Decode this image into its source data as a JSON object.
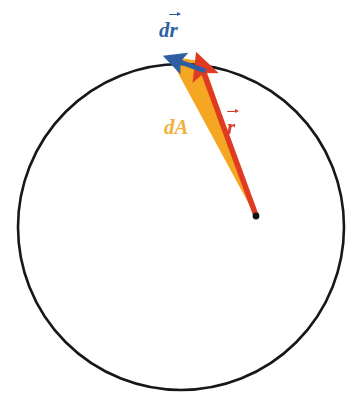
{
  "figure": {
    "background_color": "#FFFFFF",
    "width": 360,
    "height": 411
  },
  "colors": {
    "circle_stroke": "#17161A",
    "wedge_fill": "#F5A623",
    "radius_vector": "#E03A22",
    "displacement_vector": "#2E5FA3",
    "dA_label": "#EFB23C",
    "origin_dot": "#111111"
  },
  "geometry": {
    "circle": {
      "cx": 181,
      "cy": 227,
      "r": 163,
      "stroke_width": 2.6
    },
    "origin_point": {
      "x": 256,
      "y": 216,
      "dot_radius": 3.4
    },
    "arc_point_start": {
      "x": 203,
      "y": 62
    },
    "arc_point_end": {
      "x": 170,
      "y": 57
    },
    "radius_vector": {
      "x1": 256,
      "y1": 216,
      "x2": 201,
      "y2": 63
    },
    "displacement_vector": {
      "x1": 205,
      "y1": 71,
      "x2": 169,
      "y2": 57
    }
  },
  "labels": {
    "displacement": {
      "prefix": "d",
      "symbol": "r",
      "vector": true,
      "text": "dr⃗"
    },
    "area": {
      "prefix": "d",
      "symbol": "A",
      "vector": false,
      "text": "dA"
    },
    "radius": {
      "prefix": "",
      "symbol": "r",
      "vector": true,
      "text": "r⃗"
    }
  },
  "elements": {
    "circle_name": "circle-outline",
    "wedge_name": "differential-area-wedge",
    "origin_name": "origin-point",
    "radius_arrow_name": "radius-vector-arrow",
    "displacement_arrow_name": "displacement-vector-arrow"
  }
}
